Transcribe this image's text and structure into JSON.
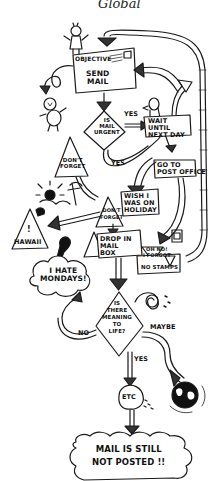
{
  "title": "Global",
  "diagram": {
    "type": "hand-drawn flowchart",
    "nodes": [
      {
        "id": "objective",
        "label": "OBJECTIVE",
        "sub": "SEND\nMAIL",
        "shape": "envelope"
      },
      {
        "id": "is_urgent",
        "label": "IS\nMAIL\nURGENT",
        "shape": "diamond"
      },
      {
        "id": "wait",
        "label": "WAIT\nUNTIL\nNEXT DAY",
        "shape": "box"
      },
      {
        "id": "post_office",
        "label": "GO TO\nPOST OFFICE",
        "shape": "box"
      },
      {
        "id": "dont_forget_1",
        "label": "DON'T\nFORGET",
        "shape": "triangle"
      },
      {
        "id": "dont_forget_2",
        "label": "DON'T\nFORGET",
        "shape": "triangle"
      },
      {
        "id": "holiday",
        "label": "WISH I\nWAS ON\nHOLIDAY",
        "shape": "box"
      },
      {
        "id": "hawaii",
        "label": "HAWAII",
        "sub": "!",
        "shape": "triangle"
      },
      {
        "id": "drop",
        "label": "DROP IN\nMAIL\nBOX",
        "shape": "box"
      },
      {
        "id": "oh_no",
        "label": "OH NO!\nI FORGOT",
        "shape": "triangle"
      },
      {
        "id": "no_stamps",
        "label": "NO STAMPS",
        "shape": "box"
      },
      {
        "id": "mondays",
        "label": "I HATE\nMONDAYS!",
        "shape": "cloud"
      },
      {
        "id": "meaning",
        "label": "IS\nTHERE\nMEANING\nTO\nLIFE?",
        "shape": "diamond"
      },
      {
        "id": "etc",
        "label": "ETC",
        "shape": "blob"
      },
      {
        "id": "result",
        "label": "MAIL IS STILL\nNOT POSTED !!",
        "shape": "cloud"
      }
    ],
    "edge_labels": {
      "urgent_yes_right": "YES",
      "urgent_yes_down": "YES",
      "meaning_no": "NO",
      "meaning_maybe": "MAYBE",
      "meaning_yes": "YES"
    }
  }
}
